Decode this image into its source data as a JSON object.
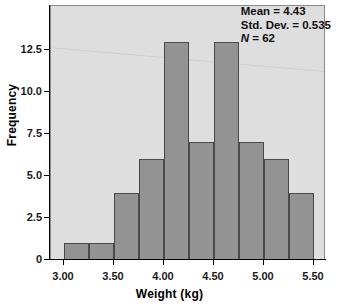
{
  "chart_data": {
    "type": "bar",
    "subtype": "histogram",
    "title": "",
    "xlabel": "Weight (kg)",
    "ylabel": "Frequency",
    "xlim": [
      2.75,
      5.75
    ],
    "ylim": [
      0,
      13.8
    ],
    "bin_width": 0.25,
    "grid": false,
    "legend": null,
    "bin_edges": [
      3.0,
      3.25,
      3.5,
      3.75,
      4.0,
      4.25,
      4.5,
      4.75,
      5.0,
      5.25,
      5.5
    ],
    "categories": [
      "3.00-3.25",
      "3.25-3.50",
      "3.50-3.75",
      "3.75-4.00",
      "4.00-4.25",
      "4.25-4.50",
      "4.50-4.75",
      "4.75-5.00",
      "5.00-5.25",
      "5.25-5.50"
    ],
    "values": [
      1,
      1,
      4,
      6,
      13,
      7,
      13,
      7,
      6,
      4
    ],
    "xticks": [
      {
        "value": 3.0,
        "label": "3.00"
      },
      {
        "value": 3.5,
        "label": "3.50"
      },
      {
        "value": 4.0,
        "label": "4.00"
      },
      {
        "value": 4.5,
        "label": "4.50"
      },
      {
        "value": 5.0,
        "label": "5.00"
      },
      {
        "value": 5.5,
        "label": "5.50"
      }
    ],
    "yticks": [
      {
        "value": 0,
        "label": "0"
      },
      {
        "value": 2.5,
        "label": "2.5"
      },
      {
        "value": 5.0,
        "label": "5.0"
      },
      {
        "value": 7.5,
        "label": "7.5"
      },
      {
        "value": 10.0,
        "label": "10.0"
      },
      {
        "value": 12.5,
        "label": "12.5"
      }
    ],
    "annotations": {
      "mean_line": "Mean = 4.43",
      "std_dev_line": "Std. Dev. = 0.535",
      "n_symbol": "N",
      "n_line": " = 62",
      "mean": 4.43,
      "std_dev": 0.535,
      "n": 62
    },
    "colors": {
      "bar_fill": "#939393",
      "bar_edge": "#4a4a4a",
      "plot_background": "#dedede",
      "figure_background": "#ffffff",
      "axis": "#000000",
      "text": "#111111"
    }
  }
}
